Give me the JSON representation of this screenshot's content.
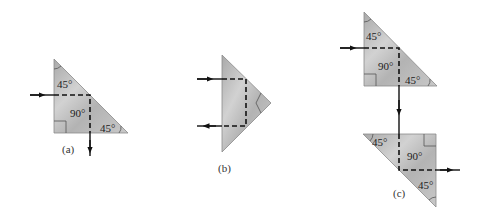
{
  "figure": {
    "colors": {
      "prism_fill": "#b9b9b9",
      "prism_edge": "#8a8a8a",
      "ray": "#111111",
      "background": "#ffffff"
    },
    "panels": [
      {
        "id": "a",
        "caption": "(a)",
        "angle_labels": [
          "45°",
          "90°",
          "45°"
        ],
        "path": "Ray enters left face horizontally, reflects 90° at hypotenuse, exits downward through bottom face"
      },
      {
        "id": "b",
        "caption": "(b)",
        "angle_labels": [],
        "path": "Ray enters hypotenuse face, reflects twice (two 90° turns), exits back in opposite direction"
      },
      {
        "id": "c",
        "caption": "(c)",
        "angle_labels_top": [
          "45°",
          "90°",
          "45°"
        ],
        "angle_labels_bottom": [
          "45°",
          "90°",
          "45°"
        ],
        "path": "Periscope arrangement: ray reflects down in top prism, travels between prisms, reflects right in bottom prism"
      }
    ]
  }
}
